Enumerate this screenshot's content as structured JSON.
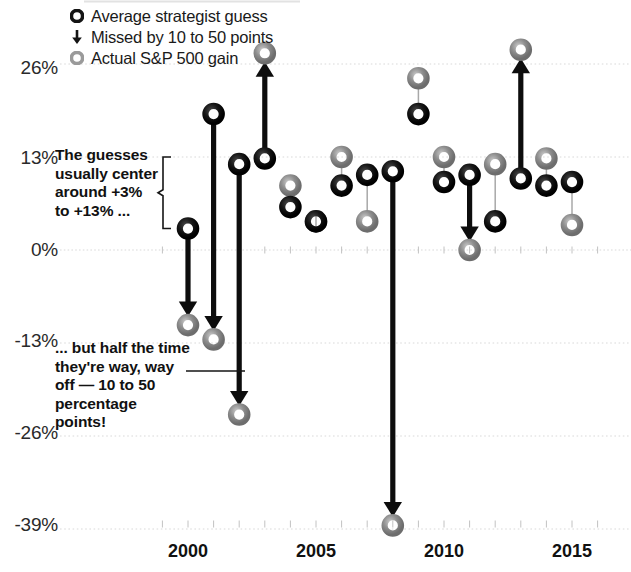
{
  "chart_data": {
    "type": "scatter",
    "title": "",
    "subtitle": "",
    "xlabel": "",
    "ylabel": "",
    "xlim": [
      1998.6,
      2016.4
    ],
    "ylim": [
      -43,
      30
    ],
    "grid": true,
    "x_ticks": [
      2000,
      2005,
      2010,
      2015
    ],
    "y_ticks": [
      26,
      13,
      0,
      -13,
      -26,
      -39
    ],
    "y_tick_labels": [
      "26%",
      "13%",
      "0%",
      "-13%",
      "-26%",
      "-39%"
    ],
    "legend_position": "top-left",
    "series": [
      {
        "name": "Average strategist guess",
        "color": "#111111"
      },
      {
        "name": "Actual S&P 500 gain",
        "color": "#8f8f8f"
      }
    ],
    "points": [
      {
        "year": 2000,
        "guess": 3.0,
        "actual": -10.5,
        "missed": true,
        "direction": "down"
      },
      {
        "year": 2001,
        "guess": 19.0,
        "actual": -12.5,
        "missed": true,
        "direction": "down"
      },
      {
        "year": 2002,
        "guess": 12.0,
        "actual": -23.0,
        "missed": true,
        "direction": "down"
      },
      {
        "year": 2003,
        "guess": 12.8,
        "actual": 27.5,
        "missed": true,
        "direction": "up"
      },
      {
        "year": 2004,
        "guess": 6.0,
        "actual": 9.0,
        "missed": false,
        "direction": "none"
      },
      {
        "year": 2005,
        "guess": 4.0,
        "actual": 4.0,
        "missed": false,
        "direction": "none"
      },
      {
        "year": 2006,
        "guess": 9.0,
        "actual": 13.0,
        "missed": false,
        "direction": "none"
      },
      {
        "year": 2007,
        "guess": 10.5,
        "actual": 4.0,
        "missed": false,
        "direction": "none"
      },
      {
        "year": 2008,
        "guess": 11.0,
        "actual": -38.5,
        "missed": true,
        "direction": "down"
      },
      {
        "year": 2009,
        "guess": 19.0,
        "actual": 24.0,
        "missed": false,
        "direction": "none"
      },
      {
        "year": 2010,
        "guess": 9.5,
        "actual": 13.0,
        "missed": false,
        "direction": "none"
      },
      {
        "year": 2011,
        "guess": 10.5,
        "actual": 0.0,
        "missed": true,
        "direction": "down"
      },
      {
        "year": 2012,
        "guess": 4.0,
        "actual": 12.0,
        "missed": false,
        "direction": "none"
      },
      {
        "year": 2013,
        "guess": 10.0,
        "actual": 28.0,
        "missed": true,
        "direction": "up"
      },
      {
        "year": 2014,
        "guess": 9.0,
        "actual": 12.8,
        "missed": false,
        "direction": "none"
      },
      {
        "year": 2015,
        "guess": 9.5,
        "actual": 3.5,
        "missed": false,
        "direction": "none"
      }
    ],
    "annotations": [
      {
        "id": "annot-1",
        "text": "The guesses usually center around +3% to +13% ...",
        "bracket_from": 13,
        "bracket_to": 3
      },
      {
        "id": "annot-2",
        "text": "... but half the time they're way, way off — 10 to 50 percentage points!"
      }
    ]
  },
  "legend": {
    "items": [
      {
        "marker": "guess-ring-icon",
        "label": "Average strategist guess"
      },
      {
        "marker": "down-arrow-icon",
        "label": "Missed by 10 to 50 points"
      },
      {
        "marker": "actual-ring-icon",
        "label": "Actual S&P 500 gain"
      }
    ]
  },
  "axis": {
    "y_labels": [
      "26%",
      "13%",
      "0%",
      "-13%",
      "-26%",
      "-39%"
    ],
    "x_labels": [
      "2000",
      "2005",
      "2010",
      "2015"
    ]
  },
  "annotations": {
    "first": "The guesses usually center around +3% to +13% ...",
    "second": "... but half the time they're way, way off — 10 to 50 percentage points!"
  },
  "colors": {
    "guess": "#111111",
    "actual": "#8f8f8f",
    "grid": "#d9d9d9",
    "text": "#1a1a1a"
  }
}
